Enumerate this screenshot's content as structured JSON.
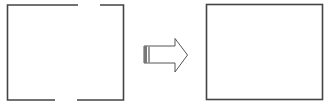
{
  "diagram": {
    "stroke_color": "#444444",
    "arrow_color": "#555555",
    "left_shape": {
      "name": "open-rectangle",
      "gaps": [
        "top-right",
        "bottom-center"
      ]
    },
    "arrow": {
      "name": "transform-arrow",
      "direction": "right"
    },
    "right_shape": {
      "name": "closed-rectangle"
    }
  }
}
